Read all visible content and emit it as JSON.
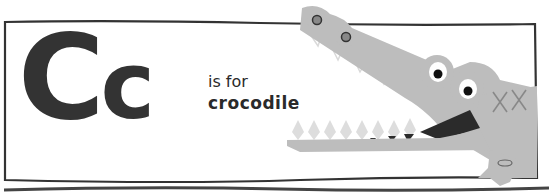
{
  "card": {
    "letter_upper": "C",
    "letter_lower": "c",
    "caption_line1": "is for",
    "caption_line2": "crocodile"
  },
  "illustration": {
    "subject": "crocodile",
    "colors": {
      "body": "#bdbdbd",
      "teeth_outline": "#d9d9d9",
      "mouth_dark": "#2b2b2b",
      "outline": "#333333",
      "eye_white": "#ffffff",
      "pupil": "#111111"
    }
  }
}
